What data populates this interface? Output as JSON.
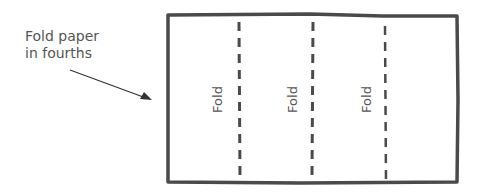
{
  "caption": {
    "line1": "Fold paper",
    "line2": "in fourths"
  },
  "folds": [
    {
      "label": "Fold"
    },
    {
      "label": "Fold"
    },
    {
      "label": "Fold"
    }
  ],
  "colors": {
    "stroke": "#4a4a4a",
    "text": "#555555"
  }
}
